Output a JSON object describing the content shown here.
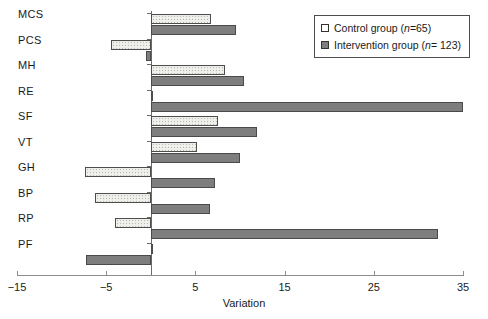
{
  "chart_data": {
    "type": "bar",
    "orientation": "horizontal",
    "title": "",
    "xlabel": "Variation",
    "ylabel": "",
    "xlim": [
      -15,
      35
    ],
    "xticks": [
      -15,
      -5,
      5,
      15,
      25,
      35
    ],
    "xticklabels": [
      "−15",
      "−5",
      "5",
      "15",
      "25",
      "35"
    ],
    "grid": false,
    "zero_line": true,
    "legend_position": "top-right",
    "categories": [
      "MCS",
      "PCS",
      "MH",
      "RE",
      "SF",
      "VT",
      "GH",
      "BP",
      "RP",
      "PF"
    ],
    "series": [
      {
        "name": "Control group (n=65)",
        "short_name": "Control group",
        "n": 65,
        "fill": "dotted-light",
        "color": "#eeeeea",
        "values": [
          6.8,
          -4.5,
          8.3,
          0.2,
          7.5,
          5.2,
          -7.4,
          -6.3,
          -4.0,
          0.3
        ]
      },
      {
        "name": "Intervention group (n=123)",
        "short_name": "Intervention group",
        "n": 123,
        "fill": "solid-gray",
        "color": "#7e7e7e",
        "values": [
          9.6,
          -0.5,
          10.5,
          35.0,
          11.9,
          10.0,
          7.2,
          6.6,
          32.2,
          -7.3
        ]
      }
    ]
  },
  "axis": {
    "x_title": "Variation",
    "tick_labels": [
      "−15",
      "−5",
      "5",
      "15",
      "25",
      "35"
    ]
  },
  "legend": {
    "items": [
      {
        "label_main": "Control group (",
        "label_n": "n",
        "label_tail": "=65)"
      },
      {
        "label_main": "Intervention group (",
        "label_n": "n",
        "label_tail": "= 123)"
      }
    ]
  },
  "category_labels": [
    "MCS",
    "PCS",
    "MH",
    "RE",
    "SF",
    "VT",
    "GH",
    "BP",
    "RP",
    "PF"
  ],
  "caption": ""
}
